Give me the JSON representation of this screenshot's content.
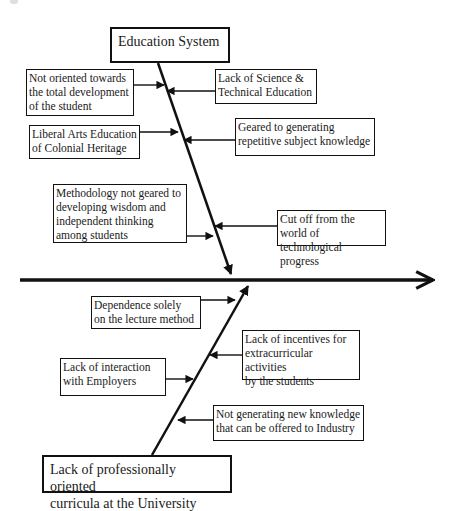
{
  "diagram": {
    "type": "fishbone",
    "head_direction": "right",
    "spine": {
      "x1": 20,
      "y1": 280,
      "x2": 433,
      "y2": 280
    },
    "upper_category": {
      "label": "Education System",
      "box": {
        "x": 110,
        "y": 27,
        "w": 120,
        "h": 36
      },
      "bone": {
        "x1": 158,
        "y1": 63,
        "x2": 231,
        "y2": 274
      },
      "causes": [
        {
          "text": "Not oriented towards\nthe total development\nof the student",
          "side": "left",
          "box": {
            "x": 26,
            "y": 69,
            "w": 108,
            "h": 47
          },
          "arrow": {
            "x1": 134,
            "y1": 85,
            "x2": 164,
            "y2": 85
          }
        },
        {
          "text": "Lack of Science &\nTechnical Education",
          "side": "right",
          "box": {
            "x": 215,
            "y": 69,
            "w": 102,
            "h": 35
          },
          "arrow": {
            "x1": 215,
            "y1": 91,
            "x2": 167,
            "y2": 91
          }
        },
        {
          "text": "Liberal Arts Education\nof Colonial Heritage",
          "side": "left",
          "box": {
            "x": 29,
            "y": 125,
            "w": 111,
            "h": 34
          },
          "arrow": {
            "x1": 140,
            "y1": 132,
            "x2": 178,
            "y2": 132
          }
        },
        {
          "text": "Geared to generating\nrepetitive subject knowledge",
          "side": "right",
          "box": {
            "x": 235,
            "y": 118,
            "w": 140,
            "h": 38
          },
          "arrow": {
            "x1": 235,
            "y1": 140,
            "x2": 184,
            "y2": 140
          }
        },
        {
          "text": "Methodology not geared to\ndeveloping wisdom and\nindependent thinking\namong students",
          "side": "left",
          "box": {
            "x": 53,
            "y": 184,
            "w": 134,
            "h": 59
          },
          "arrow": {
            "x1": 187,
            "y1": 236,
            "x2": 213,
            "y2": 236
          }
        },
        {
          "text": "Cut off from the world of\ntechnological progress",
          "side": "right",
          "box": {
            "x": 277,
            "y": 210,
            "w": 109,
            "h": 36
          },
          "arrow": {
            "x1": 277,
            "y1": 226,
            "x2": 215,
            "y2": 226
          }
        }
      ]
    },
    "lower_category": {
      "label": "Lack of professionally oriented\ncurricula at the University",
      "box": {
        "x": 42,
        "y": 455,
        "w": 190,
        "h": 38
      },
      "bone": {
        "x1": 152,
        "y1": 455,
        "x2": 248,
        "y2": 286
      },
      "causes": [
        {
          "text": "Dependence solely\non the lecture method",
          "side": "left",
          "box": {
            "x": 91,
            "y": 296,
            "w": 110,
            "h": 33
          },
          "arrow": {
            "x1": 201,
            "y1": 300,
            "x2": 235,
            "y2": 300
          }
        },
        {
          "text": "Lack of incentives for\nextracurricular activities\nby the students",
          "side": "right",
          "box": {
            "x": 242,
            "y": 330,
            "w": 118,
            "h": 50
          },
          "arrow": {
            "x1": 242,
            "y1": 355,
            "x2": 210,
            "y2": 355
          }
        },
        {
          "text": "Lack of interaction\nwith Employers",
          "side": "left",
          "box": {
            "x": 60,
            "y": 358,
            "w": 106,
            "h": 38
          },
          "arrow": {
            "x1": 166,
            "y1": 379,
            "x2": 193,
            "y2": 379
          }
        },
        {
          "text": "Not generating new knowledge\nthat can be offered to Industry",
          "side": "right",
          "box": {
            "x": 213,
            "y": 405,
            "w": 151,
            "h": 36
          },
          "arrow": {
            "x1": 213,
            "y1": 420,
            "x2": 178,
            "y2": 420
          }
        }
      ]
    },
    "colors": {
      "line": "#111111",
      "background": "#ffffff",
      "box_border": "#111111"
    }
  }
}
